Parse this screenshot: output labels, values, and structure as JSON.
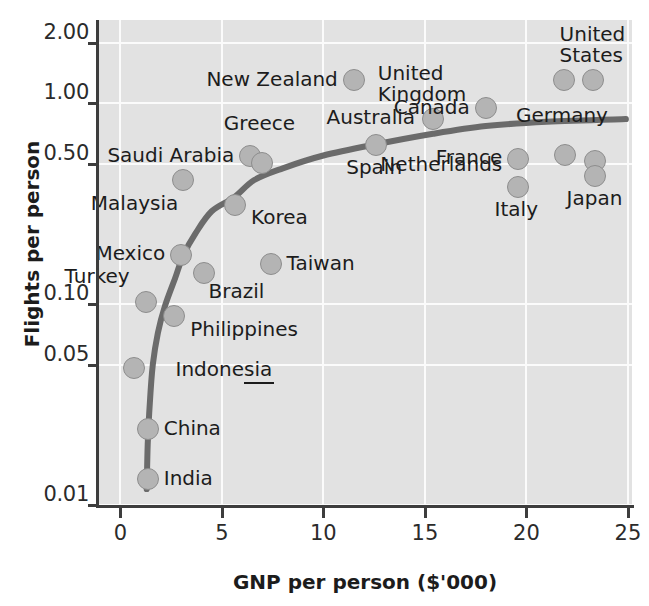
{
  "chart_data": {
    "type": "scatter",
    "title": "",
    "xlabel": "GNP per person ($'000)",
    "ylabel": "Flights per person",
    "xlim": [
      -1.1,
      25.2
    ],
    "ylim_log": [
      0.01,
      2.6
    ],
    "yscale": "log",
    "xticks": [
      0,
      5,
      10,
      15,
      20,
      25
    ],
    "xticklabels": [
      "0",
      "5",
      "10",
      "15",
      "20",
      "25"
    ],
    "yticks": [
      0.01,
      0.05,
      0.1,
      0.5,
      1.0,
      2.0
    ],
    "yticklabels": [
      "0.01",
      "0.05",
      "0.10",
      "0.50",
      "1.00",
      "2.00"
    ],
    "grid": true,
    "legend": "none",
    "marker_color": "#b4b4b4",
    "marker_edge_color": "#8d8d8d",
    "trend_color": "#6b6b6b",
    "plot_background": "#e2e2e2",
    "gridline_color": "#fbfbfb",
    "axis_color": "#3d3d3d",
    "points": [
      {
        "name": "India",
        "x": 1.35,
        "y": 0.0135,
        "label_dx": 16,
        "label_dy": -11,
        "anchor": "start"
      },
      {
        "name": "China",
        "x": 1.35,
        "y": 0.0238,
        "label_dx": 16,
        "label_dy": -11,
        "anchor": "start"
      },
      {
        "name": "Indonesia",
        "x": 0.65,
        "y": 0.048,
        "label_dx": 42,
        "label_dy": -9,
        "anchor": "start"
      },
      {
        "name": "Philippines",
        "x": 2.65,
        "y": 0.087,
        "label_dx": 16,
        "label_dy": 3,
        "anchor": "start"
      },
      {
        "name": "Turkey",
        "x": 1.25,
        "y": 0.103,
        "label_dx": -16,
        "label_dy": -36,
        "anchor": "end"
      },
      {
        "name": "Brazil",
        "x": 4.1,
        "y": 0.143,
        "label_dx": 5,
        "label_dy": 8,
        "anchor": "start"
      },
      {
        "name": "Mexico",
        "x": 3.0,
        "y": 0.176,
        "label_dx": -16,
        "label_dy": -12,
        "anchor": "end"
      },
      {
        "name": "Taiwan",
        "x": 7.4,
        "y": 0.159,
        "label_dx": 16,
        "label_dy": -11,
        "anchor": "start"
      },
      {
        "name": "Korea",
        "x": 5.65,
        "y": 0.31,
        "label_dx": 16,
        "label_dy": 2,
        "anchor": "start"
      },
      {
        "name": "Malaysia",
        "x": 3.1,
        "y": 0.413,
        "label_dx": -5,
        "label_dy": 13,
        "anchor": "end"
      },
      {
        "name": "Saudi Arabia",
        "x": 6.4,
        "y": 0.545,
        "label_dx": -16,
        "label_dy": -11,
        "anchor": "end"
      },
      {
        "name": "Greece",
        "x": 7.0,
        "y": 0.505,
        "label_dx": -3,
        "label_dy": -50,
        "anchor": "mid"
      },
      {
        "name": "Spain",
        "x": 12.6,
        "y": 0.62,
        "label_dx": -2,
        "label_dy": 12,
        "anchor": "mid"
      },
      {
        "name": "Australia",
        "x": 15.4,
        "y": 0.84,
        "label_dx": -18,
        "label_dy": -12,
        "anchor": "end"
      },
      {
        "name": "New Zealand",
        "x": 11.5,
        "y": 1.3,
        "label_dx": -16,
        "label_dy": -11,
        "anchor": "end"
      },
      {
        "name": "United\nKingdom",
        "x": 15.4,
        "y": 0.84,
        "label_dx": -11,
        "label_dy": -56,
        "anchor": "mid"
      },
      {
        "name": "Canada",
        "x": 18.0,
        "y": 0.95,
        "label_dx": -16,
        "label_dy": -11,
        "anchor": "end"
      },
      {
        "name": "United\nStates",
        "x": 23.3,
        "y": 1.3,
        "label_dx": -1,
        "label_dy": -56,
        "anchor": "mid"
      },
      {
        "name": "Netherlands",
        "x": 19.6,
        "y": 0.385,
        "label_dx": -16,
        "label_dy": -33,
        "anchor": "end"
      },
      {
        "name": "France",
        "x": 19.6,
        "y": 0.53,
        "label_dx": -16,
        "label_dy": -12,
        "anchor": "end"
      },
      {
        "name": "Italy",
        "x": 19.6,
        "y": 0.385,
        "label_dx": -2,
        "label_dy": 12,
        "anchor": "mid"
      },
      {
        "name": "Germany",
        "x": 21.9,
        "y": 0.55,
        "label_dx": -3,
        "label_dy": -50,
        "anchor": "mid"
      },
      {
        "name": "Japan",
        "x": 23.4,
        "y": 0.435,
        "label_dx": -1,
        "label_dy": 12,
        "anchor": "mid"
      }
    ],
    "markers": [
      {
        "name": "India",
        "x": 1.35,
        "y": 0.0135
      },
      {
        "name": "China",
        "x": 1.35,
        "y": 0.0238
      },
      {
        "name": "Indonesia",
        "x": 0.65,
        "y": 0.048
      },
      {
        "name": "Philippines",
        "x": 2.65,
        "y": 0.087
      },
      {
        "name": "Turkey",
        "x": 1.25,
        "y": 0.103
      },
      {
        "name": "Brazil",
        "x": 4.1,
        "y": 0.143
      },
      {
        "name": "Mexico",
        "x": 3.0,
        "y": 0.176
      },
      {
        "name": "Taiwan",
        "x": 7.4,
        "y": 0.159
      },
      {
        "name": "Korea",
        "x": 5.65,
        "y": 0.31
      },
      {
        "name": "Malaysia",
        "x": 3.1,
        "y": 0.413
      },
      {
        "name": "Saudi Arabia",
        "x": 6.4,
        "y": 0.545
      },
      {
        "name": "Greece",
        "x": 7.0,
        "y": 0.505
      },
      {
        "name": "Spain",
        "x": 12.6,
        "y": 0.62
      },
      {
        "name": "Australia",
        "x": 15.4,
        "y": 0.84
      },
      {
        "name": "New Zealand",
        "x": 11.5,
        "y": 1.3
      },
      {
        "name": "Canada",
        "x": 18.0,
        "y": 0.95
      },
      {
        "name": "United States",
        "x": 23.3,
        "y": 1.3
      },
      {
        "name": "United Kingdom",
        "x": 21.85,
        "y": 1.3
      },
      {
        "name": "France",
        "x": 19.6,
        "y": 0.53
      },
      {
        "name": "Netherlands",
        "x": 19.6,
        "y": 0.385
      },
      {
        "name": "Germany",
        "x": 21.9,
        "y": 0.55
      },
      {
        "name": "Germany2",
        "x": 23.4,
        "y": 0.515
      },
      {
        "name": "Japan",
        "x": 23.4,
        "y": 0.435
      }
    ],
    "trend_curve": [
      {
        "x": 1.3,
        "y": 0.012
      },
      {
        "x": 1.35,
        "y": 0.02
      },
      {
        "x": 1.45,
        "y": 0.032
      },
      {
        "x": 1.6,
        "y": 0.05
      },
      {
        "x": 1.85,
        "y": 0.072
      },
      {
        "x": 2.2,
        "y": 0.098
      },
      {
        "x": 2.7,
        "y": 0.135
      },
      {
        "x": 3.1,
        "y": 0.175
      },
      {
        "x": 3.7,
        "y": 0.225
      },
      {
        "x": 4.5,
        "y": 0.29
      },
      {
        "x": 5.6,
        "y": 0.34
      },
      {
        "x": 6.6,
        "y": 0.415
      },
      {
        "x": 8.0,
        "y": 0.475
      },
      {
        "x": 10.0,
        "y": 0.55
      },
      {
        "x": 12.6,
        "y": 0.625
      },
      {
        "x": 15.4,
        "y": 0.705
      },
      {
        "x": 18.0,
        "y": 0.77
      },
      {
        "x": 21.0,
        "y": 0.81
      },
      {
        "x": 24.9,
        "y": 0.835
      }
    ]
  }
}
